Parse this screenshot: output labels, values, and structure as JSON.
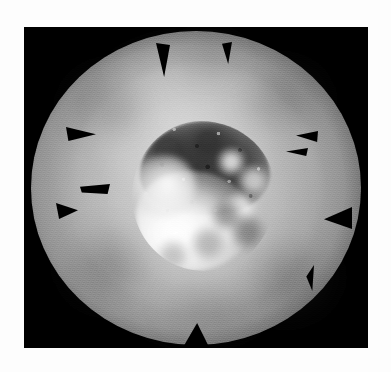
{
  "image": {
    "title": "Grayscale telescopic disc image",
    "subject_description": "Bright circular disc with a dark mottled central crater and brilliant white ejecta, surrounded by a soft luminous halo fading to black, with dark triangular fiducial wedges around the rim",
    "width_px": 391,
    "height_px": 372,
    "background_color": "#ffffff",
    "plate": {
      "label": "detector-plate",
      "x_px": 24,
      "y_px": 27,
      "width_px": 344,
      "height_px": 321,
      "color": "#000000"
    },
    "disc": {
      "label": "luminous-disc",
      "center_x_px": 196,
      "center_y_px": 188,
      "radius_x_px": 158,
      "radius_y_px": 152,
      "mean_gray": "#b0b0b0",
      "edge_falloff": "soft vignette"
    },
    "core": {
      "label": "central-crater",
      "center_x_px": 196,
      "center_y_px": 194,
      "radius_px": 72,
      "dark_floor_gray": "#606060",
      "bright_ejecta_gray": "#ffffff",
      "texture": "mottled speckled terrain"
    },
    "markers": {
      "label": "fiducial-wedges",
      "count": 9,
      "color": "#000000",
      "shape": "triangular wedge pointing inward from rim"
    }
  },
  "wedges": [
    {
      "name": "wedge-top-left",
      "left": 132,
      "top": 16,
      "w": 14,
      "h": 34,
      "clip": "polygon(0% 0%, 100% 6%, 58% 100%)"
    },
    {
      "name": "wedge-top-right",
      "left": 198,
      "top": 15,
      "w": 10,
      "h": 22,
      "clip": "polygon(0% 8%, 100% 0%, 62% 100%)"
    },
    {
      "name": "wedge-left-upper",
      "left": 42,
      "top": 100,
      "w": 30,
      "h": 14,
      "clip": "polygon(0% 0%, 100% 52%, 8% 100%)"
    },
    {
      "name": "wedge-left-mid",
      "left": 56,
      "top": 157,
      "w": 30,
      "h": 10,
      "clip": "polygon(0% 28%, 100% 0%, 92% 100%, 6% 84%)"
    },
    {
      "name": "wedge-left-lower",
      "left": 32,
      "top": 176,
      "w": 22,
      "h": 16,
      "clip": "polygon(0% 0%, 100% 46%, 14% 100%)"
    },
    {
      "name": "wedge-right-upper",
      "left": 272,
      "top": 104,
      "w": 22,
      "h": 11,
      "clip": "polygon(100% 0%, 96% 100%, 0% 42%)"
    },
    {
      "name": "wedge-right-upper-2",
      "left": 262,
      "top": 120,
      "w": 22,
      "h": 9,
      "clip": "polygon(100% 10%, 92% 100%, 0% 50%)"
    },
    {
      "name": "wedge-right-mid",
      "left": 300,
      "top": 180,
      "w": 28,
      "h": 22,
      "clip": "polygon(100% 0%, 100% 100%, 0% 56%)"
    },
    {
      "name": "wedge-right-lower",
      "left": 278,
      "top": 238,
      "w": 12,
      "h": 26,
      "clip": "polygon(100% 0%, 86% 100%, 36% 44%)"
    },
    {
      "name": "wedge-bottom",
      "left": 158,
      "top": 296,
      "w": 28,
      "h": 26,
      "clip": "polygon(54% 0%, 100% 100%, 0% 100%)"
    }
  ]
}
